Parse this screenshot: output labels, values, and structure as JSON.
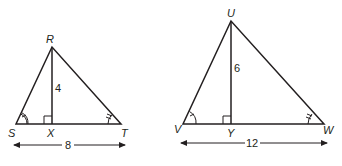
{
  "diagram": {
    "type": "geometry-similar-triangles",
    "triangles": [
      {
        "name": "triangle-RST",
        "vertices": {
          "top": "R",
          "left": "S",
          "right": "T",
          "foot": "X"
        },
        "altitude_label": "4",
        "base_label": "8",
        "marks": {
          "left_angle": "single-arc-tick",
          "right_angle": "double-arc-tick",
          "foot": "right-angle"
        }
      },
      {
        "name": "triangle-UVW",
        "vertices": {
          "top": "U",
          "left": "V",
          "right": "W",
          "foot": "Y"
        },
        "altitude_label": "6",
        "base_label": "12",
        "marks": {
          "left_angle": "single-arc-tick",
          "right_angle": "double-arc-tick",
          "foot": "right-angle"
        }
      }
    ],
    "colors": {
      "ink": "#231f20",
      "background": "#ffffff"
    }
  }
}
